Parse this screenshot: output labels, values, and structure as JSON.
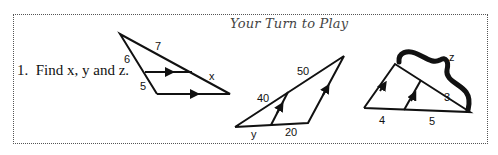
{
  "worksheet": {
    "title": "Your Turn to Play",
    "problem": {
      "number": "1.",
      "prompt": "Find x, y and z."
    },
    "figures": [
      {
        "id": "triangle-1",
        "labels": {
          "side_top": "7",
          "side_left_upper": "6",
          "side_left_lower": "5",
          "side_right_lower": "x"
        }
      },
      {
        "id": "triangle-2",
        "labels": {
          "hyp_lower": "40",
          "hyp_upper": "50",
          "base_left": "y",
          "base_right": "20"
        }
      },
      {
        "id": "triangle-3",
        "labels": {
          "brace": "z",
          "hyp_lower": "3",
          "base_left": "4",
          "base_right": "5"
        }
      }
    ]
  }
}
